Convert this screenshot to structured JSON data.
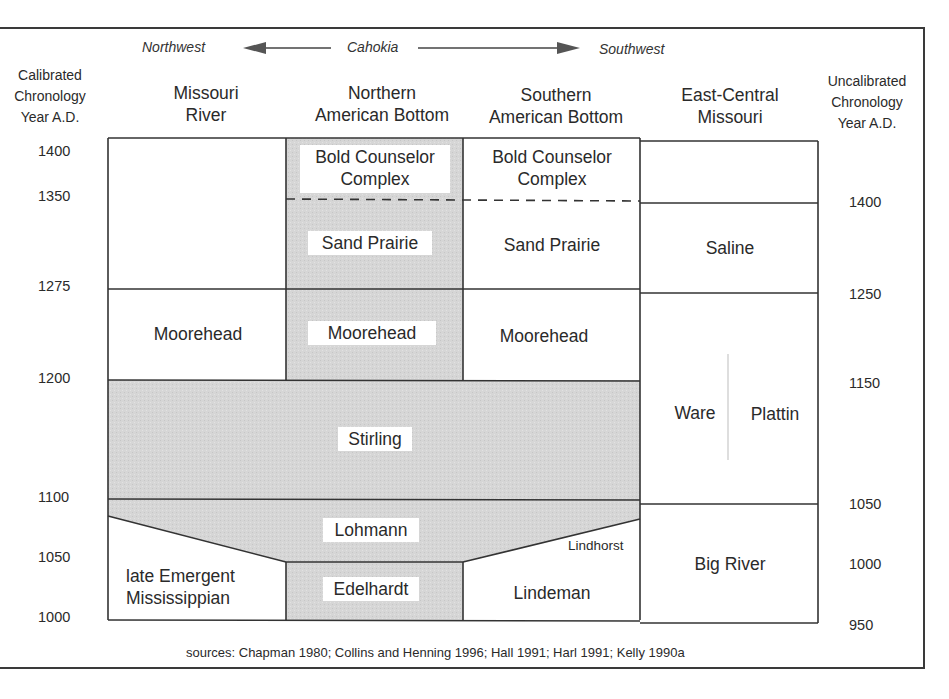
{
  "header": {
    "direction_left": "Northwest",
    "direction_center": "Cahokia",
    "direction_right": "Southwest"
  },
  "axes": {
    "left_title": [
      "Calibrated",
      "Chronology",
      "Year A.D."
    ],
    "right_title": [
      "Uncalibrated",
      "Chronology",
      "Year A.D."
    ],
    "left_ticks": [
      "1400",
      "1350",
      "1275",
      "1200",
      "1100",
      "1050",
      "1000"
    ],
    "right_ticks": [
      "1400",
      "1250",
      "1150",
      "1050",
      "1000",
      "950"
    ]
  },
  "columns": [
    {
      "line1": "Missouri",
      "line2": "River"
    },
    {
      "line1": "Northern",
      "line2": "American Bottom"
    },
    {
      "line1": "Southern",
      "line2": "American Bottom"
    },
    {
      "line1": "East-Central",
      "line2": "Missouri"
    }
  ],
  "phases": {
    "nab_bold_counselor": [
      "Bold Counselor",
      "Complex"
    ],
    "sab_bold_counselor": [
      "Bold Counselor",
      "Complex"
    ],
    "nab_sand_prairie": "Sand Prairie",
    "sab_sand_prairie": "Sand Prairie",
    "ecm_saline": "Saline",
    "mr_moorehead": "Moorehead",
    "nab_moorehead": "Moorehead",
    "sab_moorehead": "Moorehead",
    "ecm_ware": "Ware",
    "ecm_plattin": "Plattin",
    "stirling": "Stirling",
    "lohmann": "Lohmann",
    "lindhorst": "Lindhorst",
    "mr_late_emergent": [
      "late Emergent",
      "Mississippian"
    ],
    "nab_edelhardt": "Edelhardt",
    "sab_lindeman": "Lindeman",
    "ecm_big_river": "Big River"
  },
  "footer": {
    "sources": "sources:  Chapman 1980; Collins and Henning 1996; Hall 1991; Harl 1991; Kelly 1990a"
  },
  "colors": {
    "shade": "#d4d4d4",
    "line": "#333333",
    "text": "#2a2a2a",
    "divider_light": "#c8c8c8"
  }
}
